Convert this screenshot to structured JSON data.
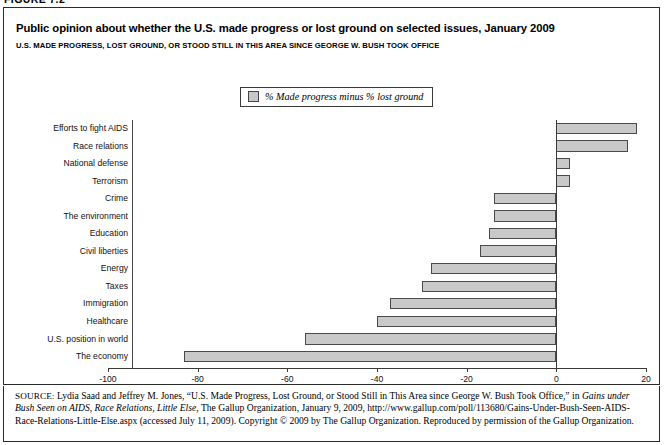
{
  "figure_label": "FIGURE 7.2",
  "header": {
    "title": "Public opinion about whether the U.S. made progress or lost ground on selected issues, January 2009",
    "subtitle": "U.S. MADE PROGRESS, LOST GROUND, OR STOOD STILL IN THIS AREA SINCE GEORGE W. BUSH TOOK OFFICE"
  },
  "legend": {
    "swatch_icon": "legend-swatch-icon",
    "label": "% Made progress minus % lost ground",
    "swatch_color": "#c9c9c9"
  },
  "axis": {
    "ticks": [
      "-100",
      "-80",
      "-60",
      "-40",
      "-20",
      "0",
      "20"
    ],
    "tick_values": [
      -100,
      -80,
      -60,
      -40,
      -20,
      0,
      20
    ],
    "min": -100,
    "max": 20
  },
  "source": {
    "key": "SOURCE:",
    "line_1_a": " Lydia Saad and Jeffrey M. Jones, “U.S. Made Progress, Lost Ground, or Stood Still in This Area since George W. Bush Took Office,” in ",
    "line_1_italic": "Gains",
    "line_2_italic": "under Bush Seen on AIDS, Race Relations, Little Else",
    "line_2_b": ", The Gallup Organization, January 9, 2009, http://www.gallup.com/poll/113680/Gains-Under-Bush-Seen-AIDS-Race-Relations-Little-Else.aspx (accessed July 11, 2009). Copyright © 2009 by The Gallup Organization. Reproduced by permission of the Gallup Organization."
  },
  "chart_data": {
    "type": "bar",
    "orientation": "horizontal",
    "title": "Public opinion about whether the U.S. made progress or lost ground on selected issues, January 2009",
    "subtitle": "U.S. MADE PROGRESS, LOST GROUND, OR STOOD STILL IN THIS AREA SINCE GEORGE W. BUSH TOOK OFFICE",
    "xlabel": "",
    "ylabel": "",
    "xlim": [
      -100,
      20
    ],
    "xticks": [
      -100,
      -80,
      -60,
      -40,
      -20,
      0,
      20
    ],
    "grid": false,
    "legend": [
      "% Made progress minus % lost ground"
    ],
    "legend_position": "top-center",
    "bar_color": "#c9c9c9",
    "bar_edge_color": "#4a4a4a",
    "categories": [
      "Efforts to fight AIDS",
      "Race relations",
      "National defense",
      "Terrorism",
      "Crime",
      "The environment",
      "Education",
      "Civil liberties",
      "Energy",
      "Taxes",
      "Immigration",
      "Healthcare",
      "U.S. position in world",
      "The economy"
    ],
    "values": [
      18,
      16,
      3,
      3,
      -14,
      -14,
      -15,
      -17,
      -28,
      -30,
      -37,
      -40,
      -56,
      -83
    ],
    "series": [
      {
        "name": "% Made progress minus % lost ground",
        "values": [
          18,
          16,
          3,
          3,
          -14,
          -14,
          -15,
          -17,
          -28,
          -30,
          -37,
          -40,
          -56,
          -83
        ]
      }
    ]
  }
}
